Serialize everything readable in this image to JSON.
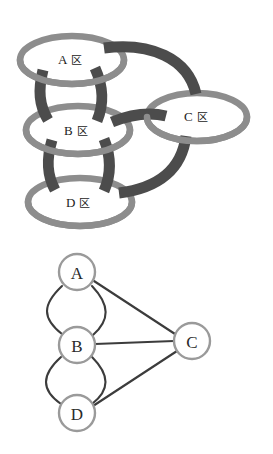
{
  "figure": {
    "panels": [
      {
        "id": "ribbon-diagram",
        "name": "thickened-graph-ribbon-diagram",
        "nodes": [
          {
            "id": "A",
            "label": "A",
            "glyph": "区",
            "cx": 72,
            "cy": 60,
            "rx": 52,
            "ry": 24
          },
          {
            "id": "B",
            "label": "B",
            "glyph": "区",
            "cx": 78,
            "cy": 130,
            "rx": 52,
            "ry": 24
          },
          {
            "id": "C",
            "label": "C",
            "glyph": "区",
            "cx": 197,
            "cy": 117,
            "rx": 50,
            "ry": 24
          },
          {
            "id": "D",
            "label": "D",
            "glyph": "区",
            "cx": 80,
            "cy": 202,
            "rx": 52,
            "ry": 24
          }
        ],
        "bands": [
          {
            "from": "A",
            "to": "B",
            "kind": "left-strut"
          },
          {
            "from": "A",
            "to": "B",
            "kind": "right-strut"
          },
          {
            "from": "B",
            "to": "D",
            "kind": "left-strut"
          },
          {
            "from": "B",
            "to": "D",
            "kind": "right-strut"
          },
          {
            "from": "A",
            "to": "C",
            "kind": "arc-over"
          },
          {
            "from": "B",
            "to": "C",
            "kind": "straight"
          },
          {
            "from": "D",
            "to": "C",
            "kind": "arc-under"
          }
        ]
      },
      {
        "id": "abstract-graph",
        "name": "abstract-multigraph",
        "nodes": [
          {
            "id": "A",
            "label": "A",
            "cx": 77,
            "cy": 272,
            "r": 18
          },
          {
            "id": "B",
            "label": "B",
            "cx": 77,
            "cy": 345,
            "r": 18
          },
          {
            "id": "C",
            "label": "C",
            "cx": 192,
            "cy": 341,
            "r": 18
          },
          {
            "id": "D",
            "label": "D",
            "cx": 77,
            "cy": 413,
            "r": 18
          }
        ],
        "edges": [
          {
            "from": "A",
            "to": "B",
            "style": "curve-left",
            "multiplicity": 1
          },
          {
            "from": "A",
            "to": "B",
            "style": "curve-right",
            "multiplicity": 1
          },
          {
            "from": "B",
            "to": "D",
            "style": "curve-left",
            "multiplicity": 1
          },
          {
            "from": "B",
            "to": "D",
            "style": "curve-right",
            "multiplicity": 1
          },
          {
            "from": "A",
            "to": "C",
            "style": "straight",
            "multiplicity": 1
          },
          {
            "from": "B",
            "to": "C",
            "style": "straight",
            "multiplicity": 1
          },
          {
            "from": "D",
            "to": "C",
            "style": "straight",
            "multiplicity": 1
          }
        ]
      }
    ],
    "colors": {
      "ring": "#8d8d8d",
      "band": "#4c4c4c",
      "edge": "#3c3c3c",
      "node_stroke": "#9a9a9a",
      "node_fill": "#ffffff",
      "text": "#1b1b1b",
      "background": "#ffffff"
    }
  }
}
